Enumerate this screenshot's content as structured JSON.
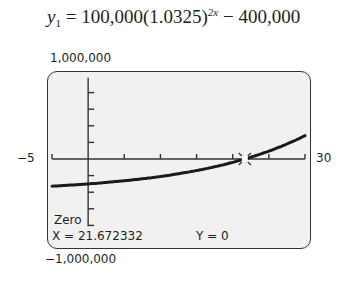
{
  "equation": {
    "lhs": "y",
    "lhs_sub": "1",
    "mid": " = 100,000(1.0325)",
    "exponent": "2x",
    "rhs": " − 400,000"
  },
  "window": {
    "ymax_label": "1,000,000",
    "ymin_label": "−1,000,000",
    "xmin_label": "−5",
    "xmax_label": "30"
  },
  "screen": {
    "mode_label": "Zero",
    "x_readout": "X = 21.672332",
    "y_readout": "Y = 0"
  },
  "chart_data": {
    "type": "line",
    "xlabel": "",
    "ylabel": "",
    "xlim": [
      -5,
      30
    ],
    "ylim": [
      -1000000,
      1000000
    ],
    "x_tick_step": 5,
    "y_tick_step": 200000,
    "grid": false,
    "series": [
      {
        "name": "y1",
        "x": [
          -5,
          0,
          5,
          10,
          15,
          20,
          21.672332,
          25,
          30
        ],
        "y": [
          -327481,
          -300000,
          -262148,
          -210390,
          -140115,
          -44693,
          0,
          131096,
          449935
        ]
      }
    ],
    "annotations": [
      {
        "label": "Zero",
        "x": 21.672332,
        "y": 0
      }
    ]
  }
}
